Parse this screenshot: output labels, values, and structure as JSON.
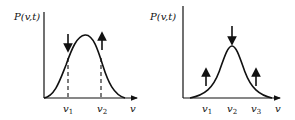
{
  "figures": [
    {
      "id": "left",
      "y_label": "P(v,t)",
      "x_label": "v",
      "ticks": [
        {
          "base": "v",
          "sub": "1"
        },
        {
          "base": "v",
          "sub": "2"
        }
      ],
      "arrows": [
        {
          "at": "v1",
          "direction": "down"
        },
        {
          "at": "v2",
          "direction": "up"
        }
      ],
      "dashed_markers": [
        "v1",
        "v2"
      ]
    },
    {
      "id": "right",
      "y_label": "P(v,t)",
      "x_label": "v",
      "ticks": [
        {
          "base": "v",
          "sub": "1"
        },
        {
          "base": "v",
          "sub": "2"
        },
        {
          "base": "v",
          "sub": "3"
        }
      ],
      "arrows": [
        {
          "at": "v1",
          "direction": "up"
        },
        {
          "at": "v2",
          "direction": "down"
        },
        {
          "at": "v3",
          "direction": "up"
        }
      ]
    }
  ],
  "colors": {
    "ink": "#111111"
  }
}
